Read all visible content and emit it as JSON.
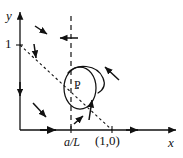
{
  "figure": {
    "type": "phase-portrait",
    "colors": {
      "ink": "#111111",
      "background": "#ffffff"
    },
    "axes": {
      "x_label": "x",
      "y_label": "y",
      "x_axis_name": "x-axis",
      "y_axis_name": "y-axis",
      "origin_px": [
        20,
        130
      ],
      "x_end_px": [
        178,
        130
      ],
      "y_end_px": [
        20,
        10
      ]
    },
    "tick_labels": {
      "y_one": "1",
      "x_aL": "a/L",
      "x_one_zero": "(1,0)"
    },
    "points": [
      {
        "name": "equilibrium-point-P",
        "label": "P",
        "x_px": 80,
        "y_px": 86
      }
    ],
    "nullclines": [
      {
        "name": "vertical-nullcline",
        "style": "dashed",
        "description": "vertical dashed line through a/L",
        "x_px": 71,
        "y_top_px": 16,
        "y_bottom_px": 130
      },
      {
        "name": "diagonal-nullcline",
        "style": "dashed",
        "description": "dashed line from (0,1) to (1,0)",
        "from_px": [
          20,
          45
        ],
        "to_px": [
          112,
          130
        ]
      }
    ],
    "orbit": {
      "name": "closed-orbit",
      "style": "solid",
      "center_px": [
        80,
        88
      ],
      "rx_px": 16,
      "ry_px": 21
    },
    "spiral_arc": {
      "name": "outer-trajectory-arc",
      "style": "solid",
      "description": "open arc curving clockwise outside the closed orbit"
    },
    "direction_field": [
      {
        "name": "arrow-upper-left-down-right",
        "x": 40,
        "y": 30,
        "angle_deg": 35,
        "length": 13
      },
      {
        "name": "arrow-on-vertical-nullcline-left",
        "x": 71,
        "y": 38,
        "angle_deg": 180,
        "length": 15
      },
      {
        "name": "arrow-on-diagonal-upper-down",
        "x": 35,
        "y": 50,
        "angle_deg": 95,
        "length": 15
      },
      {
        "name": "arrow-upper-right-down-left",
        "x": 110,
        "y": 72,
        "angle_deg": 215,
        "length": 15
      },
      {
        "name": "arrow-on-y-axis-down",
        "x": 20,
        "y": 88,
        "angle_deg": 90,
        "length": 14
      },
      {
        "name": "arrow-lower-left-down-right",
        "x": 40,
        "y": 110,
        "angle_deg": 42,
        "length": 15
      },
      {
        "name": "arrow-on-diagonal-lower-up",
        "x": 90,
        "y": 110,
        "angle_deg": 278,
        "length": 17
      },
      {
        "name": "arrow-lower-mid-up-right",
        "x": 80,
        "y": 120,
        "angle_deg": 305,
        "length": 10
      },
      {
        "name": "arrow-on-x-axis-right",
        "x": 48,
        "y": 130,
        "angle_deg": 0,
        "length": 15
      },
      {
        "name": "arrow-on-x-axis-right-outer",
        "x": 135,
        "y": 130,
        "angle_deg": 0,
        "length": 12
      }
    ]
  }
}
